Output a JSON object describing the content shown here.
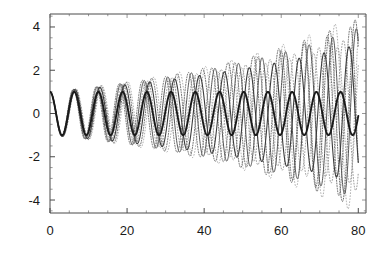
{
  "chart_data": {
    "type": "line",
    "title": "",
    "subtitle": "",
    "xlabel": "",
    "ylabel": "",
    "xlim": [
      0,
      82
    ],
    "ylim": [
      -4.6,
      4.6
    ],
    "grid": false,
    "legend": null,
    "legend_position": "none",
    "background_color": "#ffffff",
    "frame_color": "#4a4a4a",
    "x_ticks_major": [
      0,
      20,
      40,
      60,
      80
    ],
    "x_tick_labels": [
      "0",
      "20",
      "40",
      "60",
      "80"
    ],
    "x_ticks_minor_step": 5,
    "y_ticks_major": [
      -4,
      -2,
      0,
      2,
      4
    ],
    "y_tick_labels": [
      "-4",
      "-2",
      "0",
      "2",
      "4"
    ],
    "y_ticks_minor_step": 0.5,
    "x_start": 0,
    "x_end": 80,
    "samples": 1400,
    "series": [
      {
        "name": "reference-unit-amplitude",
        "color": "#1a1a1a",
        "width": 1.9,
        "dash": "none",
        "amplitude0": 1.0,
        "growth": 0.0,
        "omega": 1.0,
        "phase": 0.0
      },
      {
        "name": "slow-growth-solid",
        "color": "#3c3c3c",
        "width": 1.1,
        "dash": "none",
        "amplitude0": 1.0,
        "growth": 0.0145,
        "omega": 0.972,
        "phase": 0.0
      },
      {
        "name": "medium-growth-solid",
        "color": "#555555",
        "width": 1.0,
        "dash": "none",
        "amplitude0": 1.0,
        "growth": 0.0172,
        "omega": 1.028,
        "phase": 0.0
      },
      {
        "name": "fast-growth-dotted-a",
        "color": "#666666",
        "width": 0.95,
        "dash": "1,1.6",
        "amplitude0": 1.0,
        "growth": 0.0185,
        "omega": 0.9525,
        "phase": 0.0
      },
      {
        "name": "fast-growth-dotted-b",
        "color": "#707070",
        "width": 0.95,
        "dash": "1,1.6",
        "amplitude0": 1.0,
        "growth": 0.0178,
        "omega": 1.048,
        "phase": 0.0
      },
      {
        "name": "faint-growth-dotted-c",
        "color": "#8a8a8a",
        "width": 0.85,
        "dash": "0.9,2.0",
        "amplitude0": 1.0,
        "growth": 0.016,
        "omega": 0.9905,
        "phase": 0.0
      },
      {
        "name": "faint-growth-dotted-d",
        "color": "#909090",
        "width": 0.85,
        "dash": "0.9,2.0",
        "amplitude0": 1.0,
        "growth": 0.015,
        "omega": 1.0105,
        "phase": 0.0
      },
      {
        "name": "outer-envelope-dotted",
        "color": "#999999",
        "width": 0.8,
        "dash": "0.8,2.2",
        "amplitude0": 1.0,
        "growth": 0.0192,
        "omega": 0.9345,
        "phase": 0.0
      }
    ]
  },
  "plot_geometry": {
    "left": 50,
    "right": 366,
    "top": 14,
    "bottom": 213
  }
}
